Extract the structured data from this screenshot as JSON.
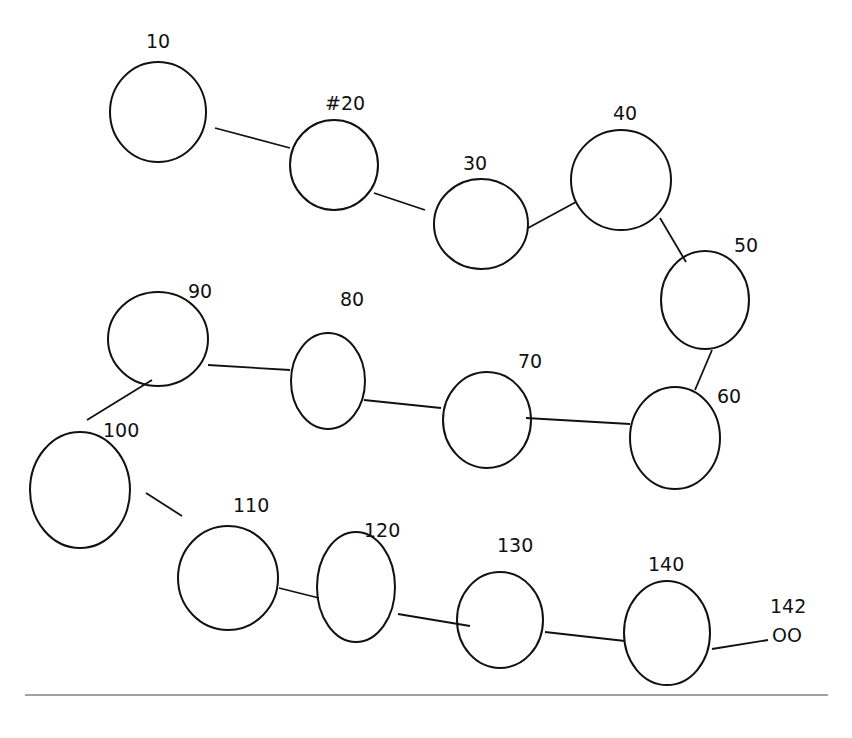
{
  "diagram": {
    "type": "linked-list",
    "stroke_color": "#111111",
    "background": "#ffffff",
    "nodes": [
      {
        "label": "10",
        "cx": 158,
        "cy": 112,
        "rx": 48,
        "ry": 50,
        "lx": 146,
        "ly": 48
      },
      {
        "label": "#20",
        "cx": 334,
        "cy": 165,
        "rx": 44,
        "ry": 45,
        "lx": 325,
        "ly": 110
      },
      {
        "label": "30",
        "cx": 481,
        "cy": 224,
        "rx": 47,
        "ry": 45,
        "lx": 463,
        "ly": 170
      },
      {
        "label": "40",
        "cx": 621,
        "cy": 180,
        "rx": 50,
        "ry": 50,
        "lx": 613,
        "ly": 120
      },
      {
        "label": "50",
        "cx": 705,
        "cy": 300,
        "rx": 44,
        "ry": 49,
        "lx": 734,
        "ly": 252
      },
      {
        "label": "60",
        "cx": 675,
        "cy": 438,
        "rx": 45,
        "ry": 51,
        "lx": 717,
        "ly": 403
      },
      {
        "label": "70",
        "cx": 487,
        "cy": 420,
        "rx": 44,
        "ry": 48,
        "lx": 518,
        "ly": 368
      },
      {
        "label": "80",
        "cx": 328,
        "cy": 381,
        "rx": 37,
        "ry": 48,
        "lx": 340,
        "ly": 306
      },
      {
        "label": "90",
        "cx": 158,
        "cy": 339,
        "rx": 50,
        "ry": 47,
        "lx": 188,
        "ly": 298
      },
      {
        "label": "100",
        "cx": 80,
        "cy": 490,
        "rx": 50,
        "ry": 58,
        "lx": 103,
        "ly": 437
      },
      {
        "label": "110",
        "cx": 228,
        "cy": 578,
        "rx": 50,
        "ry": 52,
        "lx": 233,
        "ly": 512
      },
      {
        "label": "120",
        "cx": 356,
        "cy": 587,
        "rx": 39,
        "ry": 55,
        "lx": 364,
        "ly": 537
      },
      {
        "label": "130",
        "cx": 500,
        "cy": 620,
        "rx": 43,
        "ry": 48,
        "lx": 497,
        "ly": 552
      },
      {
        "label": "140",
        "cx": 667,
        "cy": 633,
        "rx": 43,
        "ry": 52,
        "lx": 648,
        "ly": 571
      },
      {
        "label": "142",
        "cx": 0,
        "cy": 0,
        "rx": 0,
        "ry": 0,
        "lx": 770,
        "ly": 613
      }
    ],
    "edges": [
      {
        "from": "10",
        "to": "#20",
        "x1": 215,
        "y1": 128,
        "x2": 290,
        "y2": 148
      },
      {
        "from": "#20",
        "to": "30",
        "x1": 374,
        "y1": 193,
        "x2": 425,
        "y2": 210
      },
      {
        "from": "30",
        "to": "40",
        "x1": 528,
        "y1": 228,
        "x2": 576,
        "y2": 202
      },
      {
        "from": "40",
        "to": "50",
        "x1": 660,
        "y1": 218,
        "x2": 686,
        "y2": 262
      },
      {
        "from": "50",
        "to": "60",
        "x1": 712,
        "y1": 350,
        "x2": 695,
        "y2": 390
      },
      {
        "from": "60",
        "to": "70",
        "x1": 630,
        "y1": 424,
        "x2": 526,
        "y2": 418
      },
      {
        "from": "70",
        "to": "80",
        "x1": 441,
        "y1": 408,
        "x2": 364,
        "y2": 400
      },
      {
        "from": "80",
        "to": "90",
        "x1": 290,
        "y1": 370,
        "x2": 208,
        "y2": 365
      },
      {
        "from": "90",
        "to": "100",
        "x1": 152,
        "y1": 380,
        "x2": 87,
        "y2": 420
      },
      {
        "from": "100",
        "to": "110",
        "x1": 146,
        "y1": 493,
        "x2": 182,
        "y2": 516
      },
      {
        "from": "110",
        "to": "120",
        "x1": 279,
        "y1": 588,
        "x2": 319,
        "y2": 598
      },
      {
        "from": "120",
        "to": "130",
        "x1": 398,
        "y1": 614,
        "x2": 470,
        "y2": 626
      },
      {
        "from": "130",
        "to": "140",
        "x1": 545,
        "y1": 632,
        "x2": 625,
        "y2": 641
      },
      {
        "from": "140",
        "to": "null",
        "x1": 712,
        "y1": 649,
        "x2": 768,
        "y2": 640
      }
    ],
    "terminator": {
      "label": "OO",
      "x": 772,
      "y": 642
    },
    "divider": {
      "x1": 25,
      "x2": 828,
      "y": 695
    }
  }
}
